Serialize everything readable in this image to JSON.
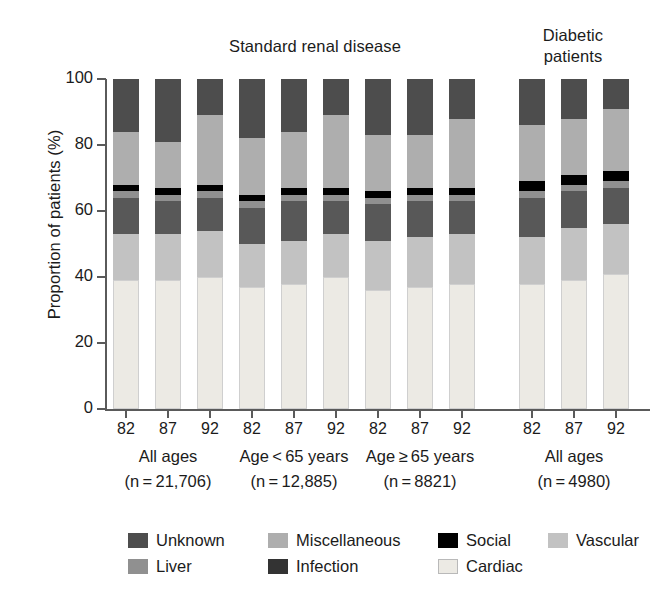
{
  "chart_data": {
    "type": "bar",
    "subtype": "stacked-percentage",
    "title": "",
    "xlabel": "",
    "ylabel": "Proportion of patients (%)",
    "ylim": [
      0,
      100
    ],
    "yticks": [
      0,
      20,
      40,
      60,
      80,
      100
    ],
    "grid": false,
    "legend_position": "bottom",
    "panel_titles": [
      "Standard renal disease",
      "Diabetic\npatients"
    ],
    "categories": [
      "82",
      "87",
      "92",
      "82",
      "87",
      "92",
      "82",
      "87",
      "92",
      "82",
      "87",
      "92"
    ],
    "groups": [
      {
        "name": "All ages",
        "n_label": "(n = 21,706)",
        "years": [
          "82",
          "87",
          "92"
        ]
      },
      {
        "name": "Age < 65 years",
        "n_label": "(n = 12,885)",
        "years": [
          "82",
          "87",
          "92"
        ]
      },
      {
        "name": "Age ≥ 65 years",
        "n_label": "(n = 8821)",
        "years": [
          "82",
          "87",
          "92"
        ]
      },
      {
        "name": "All ages",
        "n_label": "(n = 4980)",
        "years": [
          "82",
          "87",
          "92"
        ]
      }
    ],
    "series": [
      {
        "name": "Cardiac",
        "color": "#eceae4",
        "outline": true,
        "values": [
          39,
          39,
          40,
          37,
          38,
          40,
          36,
          37,
          38,
          38,
          39,
          41
        ]
      },
      {
        "name": "Vascular",
        "color": "#c2c2c2",
        "outline": false,
        "values": [
          14,
          14,
          14,
          13,
          13,
          13,
          15,
          15,
          15,
          14,
          16,
          15
        ]
      },
      {
        "name": "Infection",
        "color": "#585858",
        "outline": false,
        "values": [
          11,
          10,
          10,
          11,
          12,
          10,
          11,
          11,
          10,
          12,
          11,
          11
        ]
      },
      {
        "name": "Liver",
        "color": "#909090",
        "outline": false,
        "values": [
          2,
          2,
          2,
          2,
          2,
          2,
          2,
          2,
          2,
          2,
          2,
          2
        ]
      },
      {
        "name": "Social",
        "color": "#000000",
        "outline": false,
        "values": [
          2,
          2,
          2,
          2,
          2,
          2,
          2,
          2,
          2,
          3,
          3,
          3
        ]
      },
      {
        "name": "Miscellaneous",
        "color": "#aeaeae",
        "outline": false,
        "values": [
          16,
          14,
          21,
          17,
          17,
          22,
          17,
          16,
          21,
          17,
          17,
          19
        ]
      },
      {
        "name": "Unknown",
        "color": "#4d4d4d",
        "outline": false,
        "values": [
          16,
          19,
          11,
          18,
          16,
          11,
          17,
          17,
          12,
          14,
          12,
          9
        ]
      }
    ],
    "legend": [
      {
        "label": "Unknown",
        "color": "#4d4d4d",
        "outline": false
      },
      {
        "label": "Miscellaneous",
        "color": "#aeaeae",
        "outline": false
      },
      {
        "label": "Social",
        "color": "#000000",
        "outline": false
      },
      {
        "label": "Vascular",
        "color": "#c2c2c2",
        "outline": false
      },
      {
        "label": "Liver",
        "color": "#909090",
        "outline": false
      },
      {
        "label": "Infection",
        "color": "#333333",
        "outline": false
      },
      {
        "label": "Cardiac",
        "color": "#eceae4",
        "outline": true
      }
    ]
  },
  "axes": {
    "y_label": "Proportion of patients (%)",
    "y_ticks": [
      "0",
      "20",
      "40",
      "60",
      "80",
      "100"
    ]
  },
  "titles": {
    "standard": "Standard renal disease",
    "diabetic": "Diabetic\npatients"
  },
  "colors": {
    "axis": "#5a5a5a",
    "text": "#1b1b1b",
    "background": "#ffffff"
  }
}
